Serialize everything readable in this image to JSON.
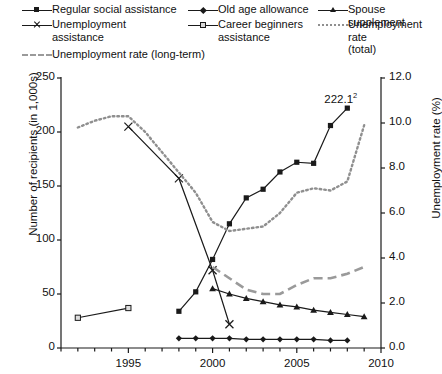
{
  "legend": {
    "items": [
      {
        "label": "Regular social assistance",
        "marker": "square-filled",
        "style": "solid",
        "col": 0,
        "row": 0
      },
      {
        "label": "Old age allowance",
        "marker": "diamond-filled",
        "style": "solid",
        "col": 1,
        "row": 0
      },
      {
        "label": "Spouse supplement",
        "marker": "triangle-filled",
        "style": "solid",
        "col": 2,
        "row": 0
      },
      {
        "label": "Unemployment\nassistance",
        "marker": "cross-x",
        "style": "solid",
        "col": 0,
        "row": 1
      },
      {
        "label": "Career beginners\nassistance",
        "marker": "square-open",
        "style": "solid",
        "col": 1,
        "row": 1
      },
      {
        "label": "Unemployment rate\n(total)",
        "marker": "none",
        "style": "dotted",
        "col": 2,
        "row": 1
      },
      {
        "label": "Unemployment rate (long-term)",
        "marker": "none",
        "style": "dashed",
        "col": 0,
        "row": 2
      }
    ]
  },
  "chart_data": {
    "type": "line",
    "title": "",
    "xlabel": "",
    "ylabel": "Number of recipients (in 1,000s)",
    "ylabel_right": "Unemployment rate (%)",
    "xlim": [
      1991,
      2010
    ],
    "ylim": [
      0,
      250
    ],
    "ylim_right": [
      0.0,
      12.0
    ],
    "yticks": [
      0,
      50,
      100,
      150,
      200,
      250
    ],
    "yticks_right": [
      "0.0",
      "2.0",
      "4.0",
      "6.0",
      "8.0",
      "10.0",
      "12.0"
    ],
    "xticks_labeled": [
      1995,
      2000,
      2005,
      2010
    ],
    "xticks_minor_step": 1,
    "grid": false,
    "legend_position": "above-plot",
    "annotations": [
      {
        "text": "222.1",
        "superscript": "2",
        "x": 2008,
        "y": 222.1,
        "series": "Regular social assistance"
      }
    ],
    "series": [
      {
        "name": "Regular social assistance",
        "axis": "left",
        "marker": "square-filled",
        "style": "solid",
        "color": "#1a1a1a",
        "points": [
          {
            "x": 1998,
            "y": 34
          },
          {
            "x": 1999,
            "y": 52
          },
          {
            "x": 2000,
            "y": 82
          },
          {
            "x": 2001,
            "y": 115
          },
          {
            "x": 2002,
            "y": 139
          },
          {
            "x": 2003,
            "y": 147
          },
          {
            "x": 2004,
            "y": 163
          },
          {
            "x": 2005,
            "y": 172
          },
          {
            "x": 2006,
            "y": 171
          },
          {
            "x": 2007,
            "y": 206
          },
          {
            "x": 2008,
            "y": 222.1
          }
        ]
      },
      {
        "name": "Old age allowance",
        "axis": "left",
        "marker": "diamond-filled",
        "style": "solid",
        "color": "#1a1a1a",
        "points": [
          {
            "x": 1998,
            "y": 9
          },
          {
            "x": 1999,
            "y": 9
          },
          {
            "x": 2000,
            "y": 9
          },
          {
            "x": 2001,
            "y": 9
          },
          {
            "x": 2002,
            "y": 8
          },
          {
            "x": 2003,
            "y": 8
          },
          {
            "x": 2004,
            "y": 8
          },
          {
            "x": 2005,
            "y": 8
          },
          {
            "x": 2006,
            "y": 8
          },
          {
            "x": 2007,
            "y": 7
          },
          {
            "x": 2008,
            "y": 7
          }
        ]
      },
      {
        "name": "Spouse supplement",
        "axis": "left",
        "marker": "triangle-filled",
        "style": "solid",
        "color": "#1a1a1a",
        "points": [
          {
            "x": 2000,
            "y": 55
          },
          {
            "x": 2001,
            "y": 50
          },
          {
            "x": 2002,
            "y": 46
          },
          {
            "x": 2003,
            "y": 43
          },
          {
            "x": 2004,
            "y": 40
          },
          {
            "x": 2005,
            "y": 38
          },
          {
            "x": 2006,
            "y": 35
          },
          {
            "x": 2007,
            "y": 33
          },
          {
            "x": 2008,
            "y": 31
          },
          {
            "x": 2009,
            "y": 29
          }
        ]
      },
      {
        "name": "Unemployment assistance",
        "axis": "left",
        "marker": "cross-x",
        "style": "solid",
        "color": "#1a1a1a",
        "points": [
          {
            "x": 1995,
            "y": 205
          },
          {
            "x": 1998,
            "y": 157
          },
          {
            "x": 2000,
            "y": 72
          },
          {
            "x": 2001,
            "y": 22
          }
        ]
      },
      {
        "name": "Career beginners assistance",
        "axis": "left",
        "marker": "square-open",
        "style": "solid",
        "color": "#1a1a1a",
        "points": [
          {
            "x": 1992,
            "y": 28
          },
          {
            "x": 1995,
            "y": 37
          }
        ]
      },
      {
        "name": "Unemployment rate (total)",
        "axis": "right",
        "marker": "none",
        "style": "dotted",
        "color": "#8f8f8f",
        "points": [
          {
            "x": 1992,
            "y": 9.8
          },
          {
            "x": 1993,
            "y": 10.1
          },
          {
            "x": 1994,
            "y": 10.3
          },
          {
            "x": 1995,
            "y": 10.3
          },
          {
            "x": 1996,
            "y": 9.6
          },
          {
            "x": 1997,
            "y": 8.7
          },
          {
            "x": 1998,
            "y": 7.8
          },
          {
            "x": 1999,
            "y": 6.9
          },
          {
            "x": 2000,
            "y": 5.6
          },
          {
            "x": 2001,
            "y": 5.2
          },
          {
            "x": 2002,
            "y": 5.3
          },
          {
            "x": 2003,
            "y": 5.4
          },
          {
            "x": 2004,
            "y": 6.0
          },
          {
            "x": 2005,
            "y": 6.9
          },
          {
            "x": 2006,
            "y": 7.1
          },
          {
            "x": 2007,
            "y": 7.0
          },
          {
            "x": 2008,
            "y": 7.4
          },
          {
            "x": 2009,
            "y": 9.9
          }
        ]
      },
      {
        "name": "Unemployment rate (long-term)",
        "axis": "right",
        "marker": "none",
        "style": "dashed",
        "color": "#9a9a9a",
        "points": [
          {
            "x": 2000,
            "y": 3.6
          },
          {
            "x": 2001,
            "y": 3.1
          },
          {
            "x": 2002,
            "y": 2.6
          },
          {
            "x": 2003,
            "y": 2.4
          },
          {
            "x": 2004,
            "y": 2.4
          },
          {
            "x": 2005,
            "y": 2.8
          },
          {
            "x": 2006,
            "y": 3.1
          },
          {
            "x": 2007,
            "y": 3.1
          },
          {
            "x": 2008,
            "y": 3.3
          },
          {
            "x": 2009,
            "y": 3.6
          }
        ]
      }
    ]
  }
}
